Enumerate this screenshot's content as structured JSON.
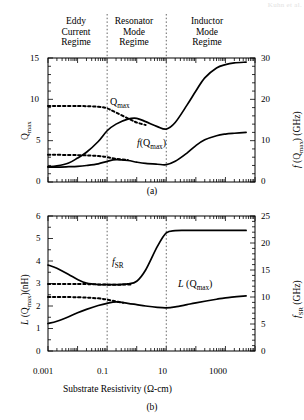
{
  "header_watermark": "Kuhn et al.",
  "regimes": [
    {
      "name": "eddy-current",
      "lines": [
        "Eddy",
        "Current",
        "Regime"
      ]
    },
    {
      "name": "resonator-mode",
      "lines": [
        "Resonator",
        "Mode",
        "Regime"
      ]
    },
    {
      "name": "inductor-mode",
      "lines": [
        "Inductor",
        "Mode",
        "Regime"
      ]
    }
  ],
  "panel_a": {
    "caption": "(a)",
    "ylabel_left": "Q",
    "ylabel_left_sub": "max",
    "ylabel_right_pre": "f",
    "ylabel_right_mid": " (Q",
    "ylabel_right_sub": "max",
    "ylabel_right_post": ") (GHz)",
    "yticks_left": [
      "0",
      "5",
      "10",
      "15"
    ],
    "yticks_right": [
      "0",
      "10",
      "20",
      "30"
    ],
    "curve_labels": {
      "qmax": "Q",
      "qmax_sub": "max",
      "fqmax_pre": "f",
      "fqmax_post": "(Q",
      "fqmax_sub": "max",
      "fqmax_end": ")"
    }
  },
  "panel_b": {
    "caption": "(b)",
    "ylabel_left_pre": "L",
    "ylabel_left_mid": " (Q",
    "ylabel_left_sub": "max",
    "ylabel_left_post": ")(nH)",
    "ylabel_right_pre": "f",
    "ylabel_right_sub": "SR",
    "ylabel_right_post": " (GHz)",
    "yticks_left": [
      "0",
      "1",
      "2",
      "3",
      "4",
      "5",
      "6"
    ],
    "yticks_right": [
      "0",
      "5",
      "10",
      "15",
      "20",
      "25"
    ],
    "curve_labels": {
      "fsr_pre": "f",
      "fsr_sub": "SR",
      "lqmax_pre": "L",
      "lqmax_mid": " (Q",
      "lqmax_sub": "max",
      "lqmax_end": ")"
    }
  },
  "xaxis": {
    "label_pre": "Substrate Resistivity (",
    "label_omega": "Ω",
    "label_post": "-cm)",
    "ticks": [
      "0.001",
      "0.1",
      "10",
      "1000"
    ]
  },
  "chart_data": [
    {
      "type": "line",
      "panel": "a",
      "title": "",
      "xlabel": "Substrate Resistivity (Ω-cm)",
      "xscale": "log",
      "xlim": [
        0.001,
        10000
      ],
      "ylabel": "Q_max",
      "ylim": [
        0,
        15
      ],
      "ylabel_right": "f(Q_max) (GHz)",
      "ylim_right": [
        0,
        30
      ],
      "grid": false,
      "legend": "inline-annotations",
      "regime_boundaries": [
        0.1,
        10
      ],
      "series": [
        {
          "name": "Q_max (solid, measured)",
          "style": "solid",
          "axis": "left",
          "x": [
            0.001,
            0.002,
            0.005,
            0.01,
            0.02,
            0.05,
            0.1,
            0.2,
            0.5,
            1,
            2,
            5,
            10,
            20,
            50,
            100,
            200,
            500,
            1000,
            2000,
            5000
          ],
          "values": [
            1.85,
            1.95,
            2.3,
            2.9,
            3.6,
            4.9,
            6.2,
            7.0,
            7.6,
            7.7,
            7.3,
            6.7,
            6.4,
            7.2,
            9.3,
            11.0,
            12.6,
            13.8,
            14.2,
            14.4,
            14.5
          ]
        },
        {
          "name": "Q_max (dashed, model)",
          "style": "dashed",
          "axis": "left",
          "x": [
            0.001,
            0.01,
            0.05,
            0.1,
            0.2,
            0.5,
            1,
            2
          ],
          "values": [
            9.2,
            9.2,
            9.1,
            8.9,
            8.4,
            7.7,
            7.2,
            6.9
          ]
        },
        {
          "name": "f(Q_max) (solid, measured)",
          "style": "solid",
          "axis": "right",
          "x": [
            0.001,
            0.002,
            0.005,
            0.01,
            0.02,
            0.05,
            0.1,
            0.2,
            0.5,
            1,
            2,
            5,
            10,
            20,
            50,
            100,
            200,
            500,
            1000,
            2000,
            5000
          ],
          "values": [
            3.6,
            3.6,
            3.7,
            3.8,
            4.0,
            4.4,
            5.0,
            5.4,
            5.2,
            4.8,
            4.5,
            4.3,
            4.2,
            5.0,
            7.0,
            8.8,
            10.2,
            11.2,
            11.6,
            11.8,
            12.0
          ]
        },
        {
          "name": "f(Q_max) (dashed, model)",
          "style": "dashed",
          "axis": "right",
          "x": [
            0.001,
            0.01,
            0.05,
            0.1,
            0.2,
            0.5
          ],
          "values": [
            6.6,
            6.5,
            6.3,
            6.0,
            5.6,
            5.3
          ]
        }
      ]
    },
    {
      "type": "line",
      "panel": "b",
      "title": "",
      "xlabel": "Substrate Resistivity (Ω-cm)",
      "xscale": "log",
      "xlim": [
        0.001,
        10000
      ],
      "ylabel": "L(Q_max) (nH)",
      "ylim": [
        0,
        6
      ],
      "ylabel_right": "f_SR (GHz)",
      "ylim_right": [
        0,
        25
      ],
      "grid": false,
      "legend": "inline-annotations",
      "regime_boundaries": [
        0.1,
        10
      ],
      "series": [
        {
          "name": "f_SR (solid, measured)",
          "style": "solid",
          "axis": "left-mapped",
          "x": [
            0.001,
            0.002,
            0.005,
            0.01,
            0.02,
            0.05,
            0.1,
            0.2,
            0.5,
            1,
            2,
            5,
            10,
            20,
            50,
            100,
            500,
            1000,
            5000
          ],
          "values": [
            3.82,
            3.68,
            3.4,
            3.18,
            3.02,
            2.95,
            2.95,
            2.95,
            2.98,
            3.1,
            3.6,
            4.65,
            5.25,
            5.35,
            5.36,
            5.36,
            5.36,
            5.36,
            5.36
          ]
        },
        {
          "name": "f_SR (dashed, model)",
          "style": "dashed",
          "axis": "left-mapped",
          "x": [
            0.001,
            0.01,
            0.05,
            0.1,
            0.3,
            0.7
          ],
          "values": [
            2.98,
            2.98,
            2.96,
            2.95,
            2.95,
            2.96
          ]
        },
        {
          "name": "L(Q_max) (solid, measured)",
          "style": "solid",
          "axis": "left",
          "x": [
            0.001,
            0.002,
            0.005,
            0.01,
            0.02,
            0.05,
            0.1,
            0.2,
            0.5,
            1,
            2,
            5,
            10,
            20,
            50,
            100,
            500,
            1000,
            5000
          ],
          "values": [
            1.22,
            1.32,
            1.52,
            1.7,
            1.85,
            2.02,
            2.12,
            2.18,
            2.12,
            2.06,
            2.0,
            1.94,
            1.92,
            1.96,
            2.06,
            2.14,
            2.3,
            2.36,
            2.45
          ]
        },
        {
          "name": "L(Q_max) (dashed, model)",
          "style": "dashed",
          "axis": "left",
          "x": [
            0.001,
            0.01,
            0.05,
            0.1,
            0.2,
            0.35
          ],
          "values": [
            2.4,
            2.39,
            2.34,
            2.28,
            2.2,
            2.14
          ]
        }
      ]
    }
  ]
}
